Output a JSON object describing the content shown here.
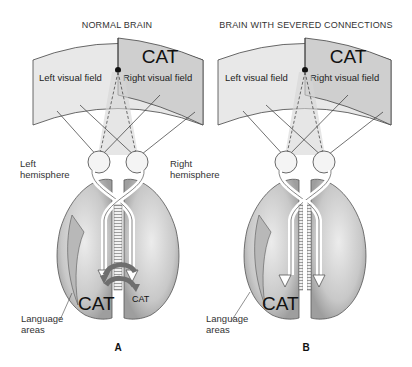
{
  "panels": [
    {
      "id": "A",
      "title": "NORMAL BRAIN",
      "left_field": "Left visual field",
      "right_field": "Right visual field",
      "stimulus": "CAT",
      "left_hemisphere_label": [
        "Left",
        "hemisphere"
      ],
      "right_hemisphere_label": [
        "Right",
        "hemisphere"
      ],
      "language_label": [
        "Language",
        "areas"
      ],
      "left_brain_word": "CAT",
      "right_brain_word": "CAT",
      "letter": "A"
    },
    {
      "id": "B",
      "title": "BRAIN WITH SEVERED CONNECTIONS",
      "left_field": "Left visual field",
      "right_field": "Right visual field",
      "stimulus": "CAT",
      "language_label": [
        "Language",
        "areas"
      ],
      "left_brain_word": "CAT",
      "letter": "B"
    }
  ],
  "colors": {
    "field_light": "#e6e6e6",
    "field_dark": "#cfcfcf",
    "brain_fill": "#c4c4c4",
    "brain_dark": "#9a9a9a",
    "arrow_dark": "#6e6e6e",
    "line": "#333333"
  }
}
